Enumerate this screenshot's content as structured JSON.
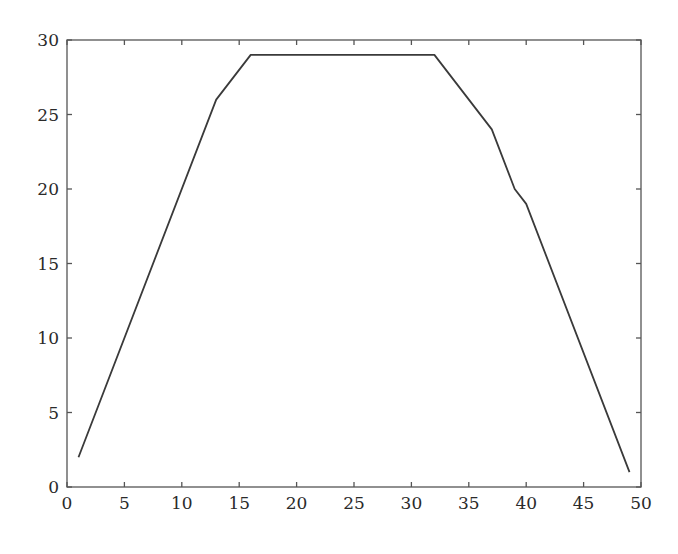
{
  "chart_data": {
    "type": "line",
    "title": "",
    "xlabel": "",
    "ylabel": "",
    "xlim": [
      0,
      50
    ],
    "ylim": [
      0,
      30
    ],
    "grid": false,
    "legend": null,
    "x_ticks": [
      0,
      5,
      10,
      15,
      20,
      25,
      30,
      35,
      40,
      45,
      50
    ],
    "y_ticks": [
      0,
      5,
      10,
      15,
      20,
      25,
      30
    ],
    "series": [
      {
        "name": "series-1",
        "color": "#3a3a3a",
        "x": [
          1,
          13,
          16,
          32,
          37,
          39,
          40,
          49
        ],
        "y": [
          2,
          26,
          29,
          29,
          24,
          20,
          19,
          1
        ]
      }
    ]
  },
  "plot_area": {
    "left": 67,
    "right": 641,
    "top": 40,
    "bottom": 487
  },
  "colors": {
    "axis": "#555555",
    "line": "#3a3a3a",
    "background": "#ffffff"
  }
}
